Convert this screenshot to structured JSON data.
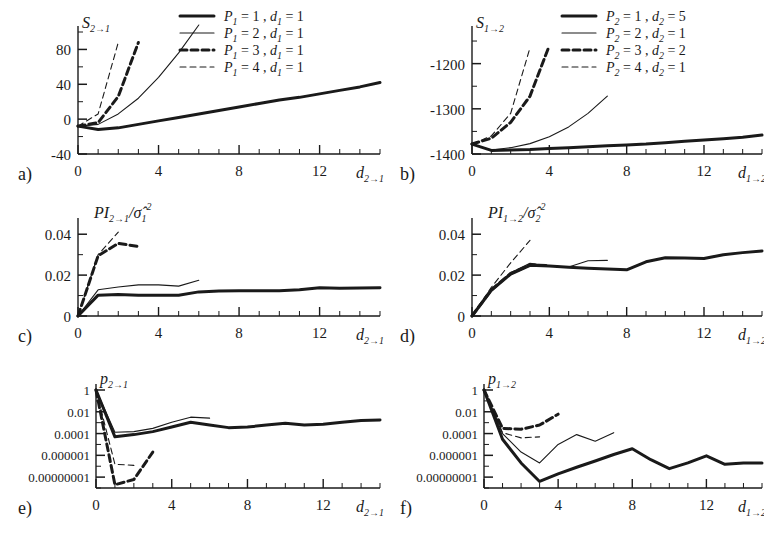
{
  "figure": {
    "panel_count": 6,
    "background": "#ffffff",
    "ink": "#1a1a1a"
  },
  "linestyles": {
    "thick_solid": {
      "width": 3.0,
      "dash": "none"
    },
    "thin_solid": {
      "width": 1.1,
      "dash": "none"
    },
    "thick_dashed": {
      "width": 3.0,
      "dash": "7,4"
    },
    "thin_dashed": {
      "width": 1.1,
      "dash": "6,4"
    }
  },
  "panels": {
    "a": {
      "id": "a)",
      "ylabel": "S",
      "ylabel_sub": "2→1",
      "xlabel": "d",
      "xlabel_sub": "2→1",
      "yticks": [
        "80",
        "40",
        "0",
        "-40"
      ],
      "xticks": [
        "0",
        "4",
        "8",
        "12"
      ],
      "legend": [
        {
          "style": "thick_solid",
          "p": "P",
          "psub": "1",
          "pval": "1",
          "d": "d",
          "dsub": "1",
          "dval": "1"
        },
        {
          "style": "thin_solid",
          "p": "P",
          "psub": "1",
          "pval": "2",
          "d": "d",
          "dsub": "1",
          "dval": "1"
        },
        {
          "style": "thick_dashed",
          "p": "P",
          "psub": "1",
          "pval": "3",
          "d": "d",
          "dsub": "1",
          "dval": "1"
        },
        {
          "style": "thin_dashed",
          "p": "P",
          "psub": "1",
          "pval": "4",
          "d": "d",
          "dsub": "1",
          "dval": "1"
        }
      ]
    },
    "b": {
      "id": "b)",
      "ylabel": "S",
      "ylabel_sub": "1→2",
      "xlabel": "d",
      "xlabel_sub": "1→2",
      "yticks": [
        "-1200",
        "-1300",
        "-1400"
      ],
      "xticks": [
        "0",
        "4",
        "8",
        "12"
      ],
      "legend": [
        {
          "style": "thick_solid",
          "p": "P",
          "psub": "2",
          "pval": "1",
          "d": "d",
          "dsub": "2",
          "dval": "5"
        },
        {
          "style": "thin_solid",
          "p": "P",
          "psub": "2",
          "pval": "2",
          "d": "d",
          "dsub": "2",
          "dval": "1"
        },
        {
          "style": "thick_dashed",
          "p": "P",
          "psub": "2",
          "pval": "3",
          "d": "d",
          "dsub": "2",
          "dval": "2"
        },
        {
          "style": "thin_dashed",
          "p": "P",
          "psub": "2",
          "pval": "4",
          "d": "d",
          "dsub": "2",
          "dval": "1"
        }
      ]
    },
    "c": {
      "id": "c)",
      "ylabel_pi": "PI",
      "ylabel_pi_sub": "2→1",
      "ylabel_sigma": "/σ̂",
      "ylabel_sigma_sub": "1",
      "ylabel_sigma_sup": "2",
      "xlabel": "d",
      "xlabel_sub": "2→1",
      "yticks": [
        "0.04",
        "0.02",
        "0"
      ],
      "xticks": [
        "0",
        "4",
        "8",
        "12"
      ]
    },
    "d": {
      "id": "d)",
      "ylabel_pi": "PI",
      "ylabel_pi_sub": "1→2",
      "ylabel_sigma": "/σ̂",
      "ylabel_sigma_sub": "2",
      "ylabel_sigma_sup": "2",
      "xlabel": "d",
      "xlabel_sub": "1→2",
      "yticks": [
        "0.04",
        "0.02",
        "0"
      ],
      "xticks": [
        "0",
        "4",
        "8",
        "12"
      ]
    },
    "e": {
      "id": "e)",
      "ylabel": "p",
      "ylabel_sub": "2→1",
      "xlabel": "d",
      "xlabel_sub": "2→1",
      "yticks": [
        "1",
        "0.01",
        "0.0001",
        "0.000001",
        "0.00000001"
      ],
      "xticks": [
        "0",
        "4",
        "8",
        "12"
      ]
    },
    "f": {
      "id": "f)",
      "ylabel": "p",
      "ylabel_sub": "1→2",
      "xlabel": "d",
      "xlabel_sub": "1→2",
      "yticks": [
        "1",
        "0.01",
        "0.0001",
        "0.000001",
        "0.00000001"
      ],
      "xticks": [
        "0",
        "4",
        "8",
        "12"
      ]
    }
  },
  "chart_data": [
    {
      "panel": "a",
      "type": "line",
      "title": "",
      "xlabel": "d_{2->1}",
      "ylabel": "S_{2->1}",
      "xlim": [
        0,
        15
      ],
      "ylim": [
        -40,
        100
      ],
      "xticks": [
        0,
        4,
        8,
        12
      ],
      "yticks": [
        -40,
        0,
        40,
        80
      ],
      "grid": false,
      "legend_position": "top-right",
      "series": [
        {
          "name": "P_1=1, d_1=1",
          "style": "thick_solid",
          "x": [
            0,
            1,
            2,
            3,
            4,
            5,
            6,
            7,
            8,
            9,
            10,
            11,
            12,
            13,
            14,
            15
          ],
          "y": [
            -8,
            -12,
            -10,
            -6,
            -2,
            2,
            6,
            10,
            14,
            18,
            22,
            25,
            29,
            33,
            37,
            42
          ]
        },
        {
          "name": "P_1=2, d_1=1",
          "style": "thin_solid",
          "x": [
            0,
            1,
            2,
            3,
            4,
            5,
            6
          ],
          "y": [
            -8,
            -6,
            6,
            24,
            48,
            76,
            108
          ]
        },
        {
          "name": "P_1=3, d_1=1",
          "style": "thick_dashed",
          "x": [
            0,
            1,
            2,
            3
          ],
          "y": [
            -8,
            -4,
            26,
            88
          ]
        },
        {
          "name": "P_1=4, d_1=1",
          "style": "thin_dashed",
          "x": [
            0,
            1,
            2
          ],
          "y": [
            -8,
            6,
            88
          ]
        }
      ]
    },
    {
      "panel": "b",
      "type": "line",
      "title": "",
      "xlabel": "d_{1->2}",
      "ylabel": "S_{1->2}",
      "xlim": [
        0,
        15
      ],
      "ylim": [
        -1400,
        -1130
      ],
      "xticks": [
        0,
        4,
        8,
        12
      ],
      "yticks": [
        -1400,
        -1300,
        -1200
      ],
      "grid": false,
      "legend_position": "top-right",
      "series": [
        {
          "name": "P_2=1, d_2=5",
          "style": "thick_solid",
          "x": [
            0,
            1,
            2,
            3,
            4,
            5,
            6,
            7,
            8,
            9,
            10,
            11,
            12,
            13,
            14,
            15
          ],
          "y": [
            -1378,
            -1392,
            -1391,
            -1390,
            -1388,
            -1386,
            -1384,
            -1382,
            -1380,
            -1378,
            -1375,
            -1372,
            -1369,
            -1366,
            -1363,
            -1358
          ]
        },
        {
          "name": "P_2=2, d_2=1",
          "style": "thin_solid",
          "x": [
            0,
            1,
            2,
            3,
            4,
            5,
            6,
            7
          ],
          "y": [
            -1378,
            -1391,
            -1386,
            -1377,
            -1362,
            -1340,
            -1310,
            -1272
          ]
        },
        {
          "name": "P_2=3, d_2=2",
          "style": "thick_dashed",
          "x": [
            0,
            1,
            2,
            3,
            4
          ],
          "y": [
            -1378,
            -1365,
            -1330,
            -1272,
            -1160
          ]
        },
        {
          "name": "P_2=4, d_2=1",
          "style": "thin_dashed",
          "x": [
            0,
            1,
            2,
            3
          ],
          "y": [
            -1378,
            -1360,
            -1310,
            -1165
          ]
        }
      ]
    },
    {
      "panel": "c",
      "type": "line",
      "title": "",
      "xlabel": "d_{2->1}",
      "ylabel": "PI_{2->1}/sigma_1^2",
      "xlim": [
        0,
        15
      ],
      "ylim": [
        0,
        0.045
      ],
      "xticks": [
        0,
        4,
        8,
        12
      ],
      "yticks": [
        0,
        0.02,
        0.04
      ],
      "grid": false,
      "series": [
        {
          "name": "P=1",
          "style": "thick_solid",
          "x": [
            0,
            1,
            2,
            3,
            4,
            5,
            6,
            7,
            8,
            9,
            10,
            11,
            12,
            13,
            14,
            15
          ],
          "y": [
            0,
            0.0102,
            0.0105,
            0.0101,
            0.0101,
            0.0102,
            0.0118,
            0.0122,
            0.0124,
            0.0124,
            0.0123,
            0.0128,
            0.0138,
            0.0136,
            0.0137,
            0.0138
          ]
        },
        {
          "name": "P=2",
          "style": "thin_solid",
          "x": [
            0,
            1,
            2,
            3,
            4,
            5,
            6
          ],
          "y": [
            0,
            0.0128,
            0.0142,
            0.0152,
            0.0152,
            0.0146,
            0.0175
          ]
        },
        {
          "name": "P=3",
          "style": "thick_dashed",
          "x": [
            0,
            1,
            2,
            3
          ],
          "y": [
            0,
            0.0295,
            0.0355,
            0.034
          ]
        },
        {
          "name": "P=4",
          "style": "thin_dashed",
          "x": [
            0,
            1,
            2
          ],
          "y": [
            0,
            0.03,
            0.041
          ]
        }
      ]
    },
    {
      "panel": "d",
      "type": "line",
      "title": "",
      "xlabel": "d_{1->2}",
      "ylabel": "PI_{1->2}/sigma_2^2",
      "xlim": [
        0,
        15
      ],
      "ylim": [
        0,
        0.045
      ],
      "xticks": [
        0,
        4,
        8,
        12
      ],
      "yticks": [
        0,
        0.02,
        0.04
      ],
      "grid": false,
      "series": [
        {
          "name": "P=1",
          "style": "thick_solid",
          "x": [
            0,
            1,
            2,
            3,
            4,
            5,
            6,
            7,
            8,
            9,
            10,
            11,
            12,
            13,
            14,
            15
          ],
          "y": [
            0,
            0.0125,
            0.0205,
            0.0248,
            0.0244,
            0.0238,
            0.0234,
            0.023,
            0.0226,
            0.0265,
            0.0285,
            0.0284,
            0.0281,
            0.03,
            0.031,
            0.0318
          ]
        },
        {
          "name": "P=2",
          "style": "thin_solid",
          "x": [
            0,
            1,
            2,
            3,
            4,
            5,
            6,
            7
          ],
          "y": [
            0,
            0.013,
            0.0212,
            0.0258,
            0.0246,
            0.024,
            0.027,
            0.0272
          ]
        },
        {
          "name": "P=3",
          "style": "thick_dashed",
          "x": [
            0,
            1,
            2,
            3,
            4
          ],
          "y": [
            0,
            0.0128,
            0.0208,
            0.025,
            0.0246
          ]
        },
        {
          "name": "P=4",
          "style": "thin_dashed",
          "x": [
            0,
            1,
            2,
            3
          ],
          "y": [
            0,
            0.014,
            0.026,
            0.037
          ]
        }
      ]
    },
    {
      "panel": "e",
      "type": "line",
      "title": "",
      "xlabel": "d_{2->1}",
      "ylabel": "p_{2->1}",
      "yscale": "log",
      "xlim": [
        0,
        15
      ],
      "ylim": [
        1e-09,
        1
      ],
      "xticks": [
        0,
        4,
        8,
        12
      ],
      "yticks": [
        1,
        0.01,
        0.0001,
        1e-06,
        1e-08
      ],
      "grid": false,
      "series": [
        {
          "name": "P=1",
          "style": "thick_solid",
          "x": [
            0,
            1,
            2,
            3,
            4,
            5,
            6,
            7,
            8,
            9,
            10,
            11,
            12,
            13,
            14,
            15
          ],
          "y": [
            1,
            5e-05,
            8e-05,
            0.00015,
            0.0004,
            0.0011,
            0.0006,
            0.00035,
            0.0004,
            0.0006,
            0.0009,
            0.0006,
            0.0007,
            0.0011,
            0.0016,
            0.0018
          ]
        },
        {
          "name": "P=2",
          "style": "thin_solid",
          "x": [
            0,
            1,
            2,
            3,
            4,
            5,
            6
          ],
          "y": [
            1,
            0.00013,
            0.00015,
            0.0003,
            0.0011,
            0.0032,
            0.0026
          ]
        },
        {
          "name": "P=3",
          "style": "thick_dashed",
          "x": [
            0,
            1,
            2,
            3
          ],
          "y": [
            1,
            2e-09,
            6e-09,
            2e-06
          ]
        },
        {
          "name": "P=4",
          "style": "thin_dashed",
          "x": [
            0,
            1,
            2
          ],
          "y": [
            1,
            1.5e-07,
            1.2e-07
          ]
        }
      ]
    },
    {
      "panel": "f",
      "type": "line",
      "title": "",
      "xlabel": "d_{1->2}",
      "ylabel": "p_{1->2}",
      "yscale": "log",
      "xlim": [
        0,
        15
      ],
      "ylim": [
        1e-09,
        1
      ],
      "xticks": [
        0,
        4,
        8,
        12
      ],
      "yticks": [
        1,
        0.01,
        0.0001,
        1e-06,
        1e-08
      ],
      "grid": false,
      "series": [
        {
          "name": "P=1",
          "style": "thick_solid",
          "x": [
            0,
            1,
            2,
            3,
            4,
            5,
            6,
            7,
            8,
            9,
            10,
            11,
            12,
            13,
            14,
            15
          ],
          "y": [
            1,
            3e-05,
            2e-07,
            4e-09,
            2e-08,
            8e-08,
            3e-07,
            1.2e-06,
            4e-06,
            4e-07,
            6e-08,
            2e-07,
            9e-07,
            1.5e-07,
            2e-07,
            2e-07
          ]
        },
        {
          "name": "P=2",
          "style": "thin_solid",
          "x": [
            0,
            1,
            2,
            3,
            4,
            5,
            6,
            7
          ],
          "y": [
            1,
            0.0001,
            2e-06,
            2e-07,
            1e-05,
            8e-05,
            2e-05,
            0.00012
          ]
        },
        {
          "name": "P=3",
          "style": "thick_dashed",
          "x": [
            0,
            1,
            2,
            3,
            4
          ],
          "y": [
            1,
            0.0003,
            0.00025,
            0.0006,
            0.006
          ]
        },
        {
          "name": "P=4",
          "style": "thin_dashed",
          "x": [
            0,
            1,
            2,
            3
          ],
          "y": [
            1,
            0.00012,
            4e-05,
            5e-05
          ]
        }
      ]
    }
  ]
}
